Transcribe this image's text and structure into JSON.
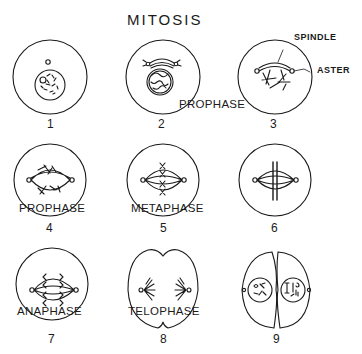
{
  "title": "MITOSIS",
  "annotations": {
    "spindle": "SPINDLE",
    "aster": "ASTER"
  },
  "stages": [
    {
      "number": "1",
      "phase_label": ""
    },
    {
      "number": "2",
      "phase_label": "PROPHASE"
    },
    {
      "number": "3",
      "phase_label": ""
    },
    {
      "number": "4",
      "phase_label": "PROPHASE"
    },
    {
      "number": "5",
      "phase_label": "METAPHASE"
    },
    {
      "number": "6",
      "phase_label": ""
    },
    {
      "number": "7",
      "phase_label": "ANAPHASE"
    },
    {
      "number": "8",
      "phase_label": "TELOPHASE"
    },
    {
      "number": "9",
      "phase_label": ""
    }
  ],
  "colors": {
    "ink": "#1a1a1a",
    "background": "#ffffff"
  }
}
